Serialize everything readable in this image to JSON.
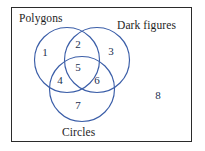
{
  "diagram": {
    "type": "venn-3-set",
    "title": "",
    "frame": {
      "label": "universal-set-frame",
      "border_color": "#2b2b2b"
    },
    "circle_color": "#3b5ea8",
    "number_color": "#22304f",
    "label_color": "#1e1e1e",
    "sets": [
      {
        "id": "polygons",
        "label": "Polygons",
        "cx": 67,
        "cy": 60,
        "r": 32.5
      },
      {
        "id": "dark-figures",
        "label": "Dark figures",
        "cx": 97,
        "cy": 60,
        "r": 32.5
      },
      {
        "id": "circles",
        "label": "Circles",
        "cx": 82,
        "cy": 89,
        "r": 32.5
      }
    ],
    "regions": [
      {
        "id": "1",
        "value": "1",
        "belongs": "Polygons only"
      },
      {
        "id": "2",
        "value": "2",
        "belongs": "Polygons and Dark figures"
      },
      {
        "id": "3",
        "value": "3",
        "belongs": "Dark figures only"
      },
      {
        "id": "4",
        "value": "4",
        "belongs": "Polygons and Circles"
      },
      {
        "id": "5",
        "value": "5",
        "belongs": "Polygons, Dark figures and Circles"
      },
      {
        "id": "6",
        "value": "6",
        "belongs": "Dark figures and Circles"
      },
      {
        "id": "7",
        "value": "7",
        "belongs": "Circles only"
      },
      {
        "id": "8",
        "value": "8",
        "belongs": "Outside all sets"
      }
    ]
  }
}
